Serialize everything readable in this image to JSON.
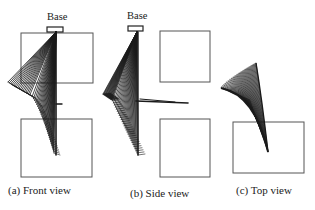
{
  "figure": {
    "panels": [
      {
        "id": "front",
        "caption": "(a) Front view",
        "base_label": "Base",
        "colors": {
          "ink": "#1a1a1a",
          "box": "#555555"
        }
      },
      {
        "id": "side",
        "caption": "(b) Side view",
        "base_label": "Base"
      },
      {
        "id": "top",
        "caption": "(c) Top view"
      }
    ]
  }
}
